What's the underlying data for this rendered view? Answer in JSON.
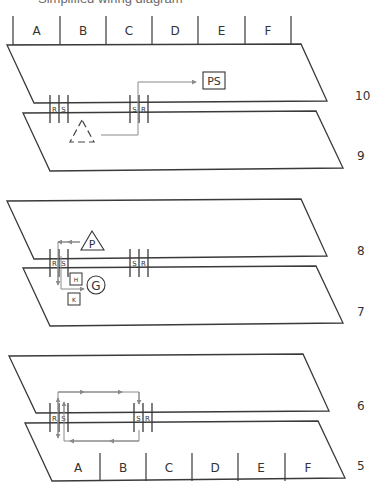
{
  "header": {
    "cut_off_text": "Simplified wiring diagram"
  },
  "colors": {
    "line": "#3a3a3a",
    "signal": "#8a8a8a",
    "text": "#333333"
  },
  "top_columns": {
    "baseline_y": 45,
    "top_y": 16,
    "dividers_x": [
      13,
      60,
      106,
      152,
      198,
      245,
      291
    ],
    "labels": [
      "A",
      "B",
      "C",
      "D",
      "E",
      "F"
    ]
  },
  "bottom_columns": {
    "baseline_y": 481,
    "top_y": 453,
    "dividers_x": [
      100,
      146,
      192,
      238,
      285
    ],
    "label_x": [
      78,
      123,
      169,
      215,
      261,
      308
    ],
    "labels": [
      "A",
      "B",
      "C",
      "D",
      "E",
      "F"
    ]
  },
  "panels": [
    {
      "id": "panel-1",
      "upper_plane": {
        "label": "10",
        "points": [
          [
            7,
            45
          ],
          [
            301,
            44
          ],
          [
            327,
            101
          ],
          [
            34,
            103
          ]
        ],
        "label_pos": [
          355,
          100
        ]
      },
      "lower_plane": {
        "label": "9",
        "points": [
          [
            23,
            113
          ],
          [
            316,
            111
          ],
          [
            343,
            168
          ],
          [
            50,
            171
          ]
        ],
        "label_pos": [
          357,
          160
        ]
      },
      "connectors": [
        {
          "x": 54,
          "letters": [
            "R",
            "S"
          ],
          "y_top": 95,
          "y_bot": 123
        },
        {
          "x": 134,
          "letters": [
            "S",
            "R"
          ],
          "y_top": 95,
          "y_bot": 123
        }
      ],
      "components": [
        {
          "type": "dashed-triangle",
          "label": "",
          "cx": 82,
          "cy": 133
        },
        {
          "type": "box",
          "label": "PS",
          "x": 203,
          "y": 72,
          "w": 22,
          "h": 16
        }
      ]
    },
    {
      "id": "panel-2",
      "upper_plane": {
        "label": "8",
        "points": [
          [
            7,
            201
          ],
          [
            301,
            199
          ],
          [
            327,
            256
          ],
          [
            34,
            259
          ]
        ],
        "label_pos": [
          357,
          255
        ]
      },
      "lower_plane": {
        "label": "7",
        "points": [
          [
            23,
            268
          ],
          [
            316,
            266
          ],
          [
            343,
            323
          ],
          [
            50,
            326
          ]
        ],
        "label_pos": [
          357,
          316
        ]
      },
      "connectors": [
        {
          "x": 54,
          "letters": [
            "R",
            "S"
          ],
          "y_top": 249,
          "y_bot": 277
        },
        {
          "x": 134,
          "letters": [
            "S",
            "R"
          ],
          "y_top": 249,
          "y_bot": 277
        }
      ],
      "components": [
        {
          "type": "triangle",
          "label": "P",
          "cx": 92,
          "cy": 240
        },
        {
          "type": "circle",
          "label": "G",
          "cx": 96,
          "cy": 285,
          "r": 9
        },
        {
          "type": "small-box",
          "label": "H",
          "x": 70,
          "y": 273,
          "w": 12,
          "h": 12
        },
        {
          "type": "small-box",
          "label": "K",
          "x": 68,
          "y": 293,
          "w": 12,
          "h": 12
        }
      ]
    },
    {
      "id": "panel-3",
      "upper_plane": {
        "label": "6",
        "points": [
          [
            9,
            356
          ],
          [
            303,
            354
          ],
          [
            329,
            411
          ],
          [
            36,
            413
          ]
        ],
        "label_pos": [
          357,
          410
        ]
      },
      "lower_plane": {
        "label": "5",
        "points": [
          [
            25,
            423
          ],
          [
            318,
            421
          ],
          [
            345,
            478
          ],
          [
            52,
            481
          ]
        ],
        "label_pos": [
          357,
          470
        ]
      },
      "connectors": [
        {
          "x": 54,
          "letters": [
            "R",
            "S"
          ],
          "y_top": 403,
          "y_bot": 432
        },
        {
          "x": 138,
          "letters": [
            "S",
            "R"
          ],
          "y_top": 403,
          "y_bot": 432
        }
      ],
      "components": []
    }
  ]
}
